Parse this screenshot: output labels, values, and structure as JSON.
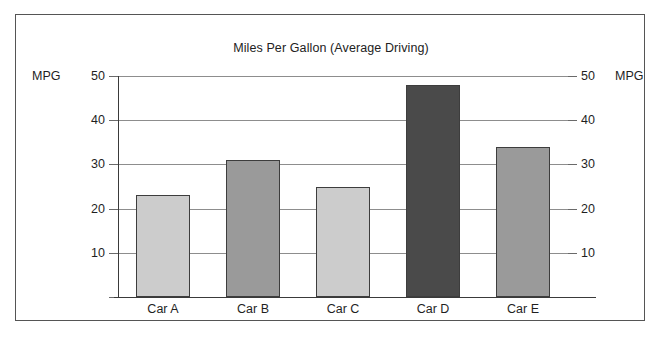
{
  "chart_data": {
    "type": "bar",
    "title": "Miles Per Gallon (Average Driving)",
    "categories": [
      "Car A",
      "Car B",
      "Car C",
      "Car D",
      "Car E"
    ],
    "values": [
      23,
      31,
      25,
      48,
      34
    ],
    "xlabel": "",
    "ylabel": "MPG",
    "ylabel_right": "MPG",
    "ylim": [
      0,
      50
    ],
    "yticks": [
      10,
      20,
      30,
      40,
      50
    ],
    "ytick_labels": [
      "10",
      "20",
      "30",
      "40",
      "50"
    ],
    "ytick_labels_right": [
      "10",
      "20",
      "30",
      "40",
      "50"
    ],
    "grid": true,
    "legend": false,
    "bar_colors": [
      "#cccccc",
      "#9a9a9a",
      "#cccccc",
      "#4a4a4a",
      "#9a9a9a"
    ],
    "bar_border_color": "#3d3d3d",
    "gridline_color": "#8d8d8d",
    "axis_color": "#3a3a3a",
    "frame_color": "#555555",
    "background": "#ffffff"
  }
}
